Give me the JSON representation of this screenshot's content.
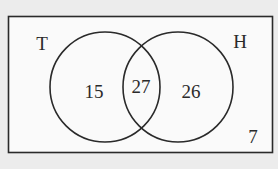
{
  "diagram": {
    "type": "venn",
    "universal_set": {
      "outside_value": "7"
    },
    "sets": [
      {
        "label": "T",
        "only_value": "15"
      },
      {
        "label": "H",
        "only_value": "26"
      }
    ],
    "intersection_value": "27",
    "colors": {
      "background": "#ececec",
      "box_fill": "#fafafa",
      "stroke": "#2a2a2a"
    }
  }
}
